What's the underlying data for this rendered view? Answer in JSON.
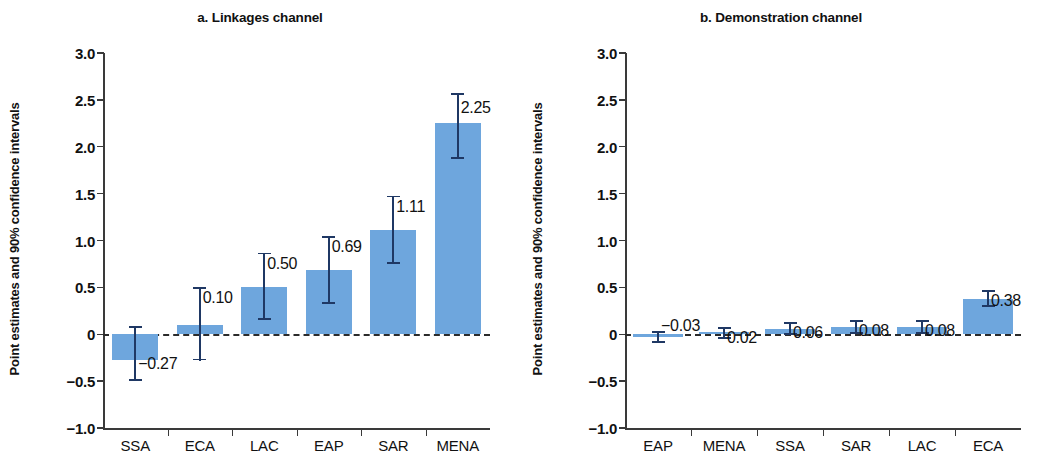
{
  "figure": {
    "width": 1041,
    "height": 457,
    "bar_color": "#6ea6dd",
    "error_bar_color": "#1f3864",
    "axis_color": "#3a3a3a",
    "zero_line_color": "#2b2b2b"
  },
  "panels": [
    {
      "key": "linkages",
      "title": "a. Linkages channel",
      "ylabel": "Point estimates and 90% confidence intervals"
    },
    {
      "key": "demonstration",
      "title": "b. Demonstration channel",
      "ylabel": "Point estimates and 90% confidence intervals"
    }
  ],
  "ytick_labels": [
    "3.0",
    "2.5",
    "2.0",
    "1.5",
    "1.0",
    "0.5",
    "0",
    "−0.5",
    "−1.0"
  ],
  "chart_data": [
    {
      "type": "bar",
      "title": "a. Linkages channel",
      "xlabel": "",
      "ylabel": "Point estimates and 90% confidence intervals",
      "ylim": [
        -1.0,
        3.0
      ],
      "yticks": [
        3.0,
        2.5,
        2.0,
        1.5,
        1.0,
        0.5,
        0,
        -0.5,
        -1.0
      ],
      "ytick_labels": [
        "3.0",
        "2.5",
        "2.0",
        "1.5",
        "1.0",
        "0.5",
        "0",
        "−0.5",
        "−1.0"
      ],
      "grid": false,
      "legend": "none",
      "zero_reference_line": 0,
      "categories": [
        "SSA",
        "ECA",
        "LAC",
        "EAP",
        "SAR",
        "MENA"
      ],
      "values": [
        -0.27,
        0.1,
        0.5,
        0.69,
        1.11,
        2.25
      ],
      "data_labels": [
        "−0.27",
        "0.10",
        "0.50",
        "0.69",
        "1.11",
        "2.25"
      ],
      "ci_low": [
        -0.5,
        -0.28,
        0.15,
        0.32,
        0.75,
        1.87
      ],
      "ci_high": [
        0.09,
        0.5,
        0.87,
        1.05,
        1.48,
        2.57
      ]
    },
    {
      "type": "bar",
      "title": "b. Demonstration channel",
      "xlabel": "",
      "ylabel": "Point estimates and 90% confidence intervals",
      "ylim": [
        -1.0,
        3.0
      ],
      "yticks": [
        3.0,
        2.5,
        2.0,
        1.5,
        1.0,
        0.5,
        0,
        -0.5,
        -1.0
      ],
      "ytick_labels": [
        "3.0",
        "2.5",
        "2.0",
        "1.5",
        "1.0",
        "0.5",
        "0",
        "−0.5",
        "−1.0"
      ],
      "grid": false,
      "legend": "none",
      "zero_reference_line": 0,
      "categories": [
        "EAP",
        "MENA",
        "SSA",
        "SAR",
        "LAC",
        "ECA"
      ],
      "values": [
        -0.03,
        0.02,
        0.06,
        0.08,
        0.08,
        0.38
      ],
      "data_labels": [
        "−0.03",
        "0.02",
        "0.06",
        "0.08",
        "0.08",
        "0.38"
      ],
      "ci_low": [
        -0.09,
        -0.05,
        -0.01,
        0.0,
        0.0,
        0.29
      ],
      "ci_high": [
        0.03,
        0.08,
        0.13,
        0.15,
        0.15,
        0.47
      ]
    }
  ]
}
